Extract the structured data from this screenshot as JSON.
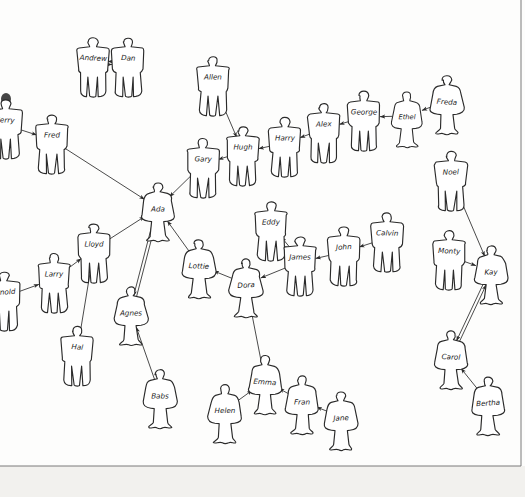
{
  "diagram": {
    "medium": "pen sketch on white paper, scanned",
    "people_count": 38,
    "edge_count": 34,
    "ink_color": "#2b2b2b",
    "paper_color": "#fdfdfc",
    "border_color": "#7a7a7a"
  },
  "people": [
    {
      "id": "andrew",
      "label": "Andrew",
      "x": 93,
      "y": 63,
      "shape": "male",
      "scale": 1.0
    },
    {
      "id": "dan",
      "label": "Dan",
      "x": 128,
      "y": 63,
      "shape": "male",
      "scale": 1.0
    },
    {
      "id": "allen",
      "label": "Allen",
      "x": 213,
      "y": 82,
      "shape": "male",
      "scale": 1.0
    },
    {
      "id": "jerry",
      "label": "Jerry",
      "x": 6,
      "y": 125,
      "shape": "male",
      "scale": 1.0
    },
    {
      "id": "fred",
      "label": "Fred",
      "x": 52,
      "y": 140,
      "shape": "male",
      "scale": 1.0
    },
    {
      "id": "hugh",
      "label": "Hugh",
      "x": 243,
      "y": 152,
      "shape": "male",
      "scale": 1.0
    },
    {
      "id": "harry",
      "label": "Harry",
      "x": 285,
      "y": 143,
      "shape": "male",
      "scale": 1.0
    },
    {
      "id": "alex",
      "label": "Alex",
      "x": 324,
      "y": 129,
      "shape": "male",
      "scale": 1.0
    },
    {
      "id": "george",
      "label": "George",
      "x": 364,
      "y": 117,
      "shape": "male",
      "scale": 1.0
    },
    {
      "id": "ethel",
      "label": "Ethel",
      "x": 407,
      "y": 116,
      "shape": "female",
      "scale": 0.94
    },
    {
      "id": "freda",
      "label": "Freda",
      "x": 447,
      "y": 101,
      "shape": "female",
      "scale": 1.0
    },
    {
      "id": "gary",
      "label": "Gary",
      "x": 203,
      "y": 164,
      "shape": "male",
      "scale": 1.0
    },
    {
      "id": "ada",
      "label": "Ada",
      "x": 158,
      "y": 208,
      "shape": "female",
      "scale": 1.0
    },
    {
      "id": "noel",
      "label": "Noel",
      "x": 451,
      "y": 177,
      "shape": "male",
      "scale": 1.0
    },
    {
      "id": "lloyd",
      "label": "Lloyd",
      "x": 94,
      "y": 249,
      "shape": "male",
      "scale": 1.0
    },
    {
      "id": "larry",
      "label": "Larry",
      "x": 54,
      "y": 279,
      "shape": "male",
      "scale": 1.0
    },
    {
      "id": "arnold",
      "label": "Arnold",
      "x": 4,
      "y": 297,
      "shape": "male",
      "scale": 1.0
    },
    {
      "id": "lottie",
      "label": "Lottie",
      "x": 199,
      "y": 265,
      "shape": "female",
      "scale": 1.0
    },
    {
      "id": "dora",
      "label": "Dora",
      "x": 246,
      "y": 284,
      "shape": "female",
      "scale": 1.0
    },
    {
      "id": "eddy",
      "label": "Eddy",
      "x": 271,
      "y": 227,
      "shape": "male",
      "scale": 1.0
    },
    {
      "id": "james",
      "label": "James",
      "x": 300,
      "y": 262,
      "shape": "male",
      "scale": 1.0
    },
    {
      "id": "john",
      "label": "John",
      "x": 344,
      "y": 252,
      "shape": "male",
      "scale": 1.0
    },
    {
      "id": "calvin",
      "label": "Calvin",
      "x": 387,
      "y": 238,
      "shape": "male",
      "scale": 1.0
    },
    {
      "id": "monty",
      "label": "Monty",
      "x": 449,
      "y": 256,
      "shape": "male",
      "scale": 1.0
    },
    {
      "id": "kay",
      "label": "Kay",
      "x": 491,
      "y": 271,
      "shape": "female",
      "scale": 1.0
    },
    {
      "id": "agnes",
      "label": "Agnes",
      "x": 131,
      "y": 312,
      "shape": "female",
      "scale": 1.0
    },
    {
      "id": "hal",
      "label": "Hal",
      "x": 77,
      "y": 352,
      "shape": "male",
      "scale": 1.0
    },
    {
      "id": "babs",
      "label": "Babs",
      "x": 160,
      "y": 395,
      "shape": "female",
      "scale": 1.0
    },
    {
      "id": "carol",
      "label": "Carol",
      "x": 451,
      "y": 356,
      "shape": "female",
      "scale": 1.0
    },
    {
      "id": "bertha",
      "label": "Bertha",
      "x": 488,
      "y": 402,
      "shape": "female",
      "scale": 1.0
    },
    {
      "id": "emma",
      "label": "Emma",
      "x": 265,
      "y": 381,
      "shape": "female",
      "scale": 1.0
    },
    {
      "id": "helen",
      "label": "Helen",
      "x": 225,
      "y": 410,
      "shape": "female",
      "scale": 1.0
    },
    {
      "id": "fran",
      "label": "Fran",
      "x": 302,
      "y": 401,
      "shape": "female",
      "scale": 1.0
    },
    {
      "id": "jane",
      "label": "Jane",
      "x": 341,
      "y": 417,
      "shape": "female",
      "scale": 1.0
    }
  ],
  "edges": [
    {
      "from": "andrew",
      "to": "dan",
      "type": "bidirectional"
    },
    {
      "from": "jerry",
      "to": "fred",
      "type": "directed"
    },
    {
      "from": "fred",
      "to": "ada",
      "type": "directed"
    },
    {
      "from": "allen",
      "to": "hugh",
      "type": "directed"
    },
    {
      "from": "freda",
      "to": "ethel",
      "type": "directed"
    },
    {
      "from": "ethel",
      "to": "george",
      "type": "directed"
    },
    {
      "from": "george",
      "to": "alex",
      "type": "directed"
    },
    {
      "from": "alex",
      "to": "harry",
      "type": "directed"
    },
    {
      "from": "harry",
      "to": "hugh",
      "type": "directed"
    },
    {
      "from": "hugh",
      "to": "gary",
      "type": "directed"
    },
    {
      "from": "gary",
      "to": "ada",
      "type": "directed"
    },
    {
      "from": "lloyd",
      "to": "ada",
      "type": "directed"
    },
    {
      "from": "lottie",
      "to": "ada",
      "type": "directed"
    },
    {
      "from": "ada",
      "to": "agnes",
      "type": "bidirectional"
    },
    {
      "from": "arnold",
      "to": "larry",
      "type": "directed"
    },
    {
      "from": "larry",
      "to": "lloyd",
      "type": "directed"
    },
    {
      "from": "hal",
      "to": "lloyd",
      "type": "directed"
    },
    {
      "from": "babs",
      "to": "agnes",
      "type": "directed"
    },
    {
      "from": "dora",
      "to": "lottie",
      "type": "directed"
    },
    {
      "from": "james",
      "to": "dora",
      "type": "directed"
    },
    {
      "from": "emma",
      "to": "dora",
      "type": "directed"
    },
    {
      "from": "eddy",
      "to": "james",
      "type": "bidirectional"
    },
    {
      "from": "john",
      "to": "james",
      "type": "directed"
    },
    {
      "from": "calvin",
      "to": "john",
      "type": "directed"
    },
    {
      "from": "noel",
      "to": "kay",
      "type": "directed"
    },
    {
      "from": "monty",
      "to": "kay",
      "type": "directed"
    },
    {
      "from": "kay",
      "to": "carol",
      "type": "bidirectional"
    },
    {
      "from": "bertha",
      "to": "carol",
      "type": "directed"
    },
    {
      "from": "helen",
      "to": "emma",
      "type": "directed"
    },
    {
      "from": "fran",
      "to": "emma",
      "type": "directed"
    },
    {
      "from": "jane",
      "to": "fran",
      "type": "directed"
    }
  ]
}
